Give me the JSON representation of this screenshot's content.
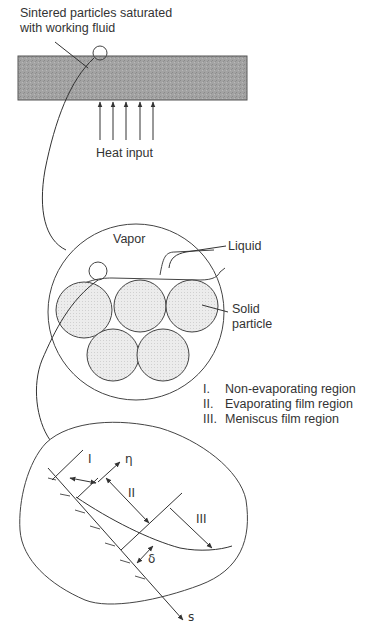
{
  "figure": {
    "top_label": {
      "line1": "Sintered particles saturated",
      "line2": "with working fluid"
    },
    "heat_label": "Heat input",
    "heat_arrow_count": 5,
    "particle_view": {
      "vapor_label": "Vapor",
      "liquid_label": "Liquid",
      "solid_label_line1": "Solid",
      "solid_label_line2": "particle"
    },
    "legend": [
      {
        "num": "I.",
        "text": "Non-evaporating region"
      },
      {
        "num": "II.",
        "text": "Evaporating film region"
      },
      {
        "num": "III.",
        "text": "Meniscus film region"
      }
    ],
    "detail_view": {
      "region_I": "I",
      "region_II": "II",
      "region_III": "III",
      "eta_symbol": "η",
      "delta_symbol": "δ",
      "s_symbol": "s"
    },
    "colors": {
      "line": "#3a3a3a",
      "block_fill": "#9a9a9a",
      "particle_fill": "#e4e4e4",
      "text": "#333333"
    }
  }
}
